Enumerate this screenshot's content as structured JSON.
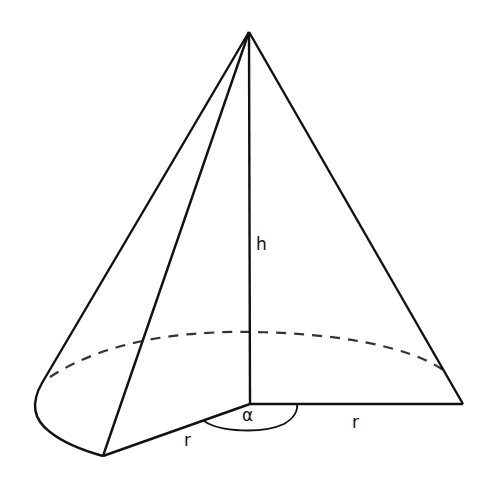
{
  "diagram": {
    "labels": {
      "height": "h",
      "radius_left": "r",
      "radius_right": "r",
      "angle": "α"
    },
    "colors": {
      "stroke": "#111111",
      "dashed": "#333333",
      "background": "#ffffff"
    },
    "points": {
      "apex": [
        249,
        32
      ],
      "center": [
        250,
        404
      ],
      "right_base": [
        463,
        404
      ],
      "left_base": [
        103,
        456
      ]
    }
  }
}
